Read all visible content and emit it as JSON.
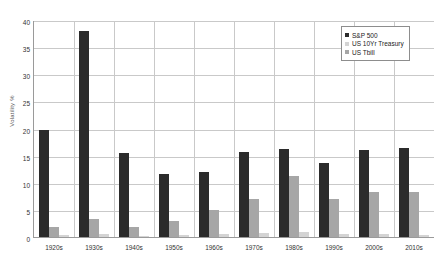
{
  "chart_data": {
    "type": "bar",
    "title": "",
    "xlabel": "",
    "ylabel": "Volatility %",
    "ylim": [
      0,
      40
    ],
    "ytick_step": 5,
    "yticks": [
      "40",
      "35",
      "30",
      "25",
      "20",
      "15",
      "10",
      "5",
      "0"
    ],
    "grid": true,
    "legend_position": "top-right",
    "categories": [
      "1920s",
      "1930s",
      "1940s",
      "1950s",
      "1960s",
      "1970s",
      "1980s",
      "1990s",
      "2000s",
      "2010s"
    ],
    "series": [
      {
        "name": "S&P 500",
        "color": "#2b2b2b",
        "values": [
          19.8,
          38.0,
          15.5,
          11.7,
          12.0,
          15.6,
          16.2,
          13.7,
          16.0,
          16.5
        ]
      },
      {
        "name": "US 10Yr Treasury",
        "color": "#a6a6a6",
        "values": [
          1.8,
          3.3,
          1.9,
          3.0,
          4.9,
          7.0,
          11.3,
          7.0,
          8.3,
          8.3
        ]
      },
      {
        "name": "US Tbill",
        "color": "#d4d4d4",
        "values": [
          0.4,
          0.5,
          0.2,
          0.3,
          0.5,
          0.8,
          0.9,
          0.5,
          0.6,
          0.3
        ]
      }
    ]
  },
  "legend": {
    "items": [
      {
        "label": "S&P 500"
      },
      {
        "label": "US 10Yr Treasury"
      },
      {
        "label": "US Tbill"
      }
    ]
  }
}
